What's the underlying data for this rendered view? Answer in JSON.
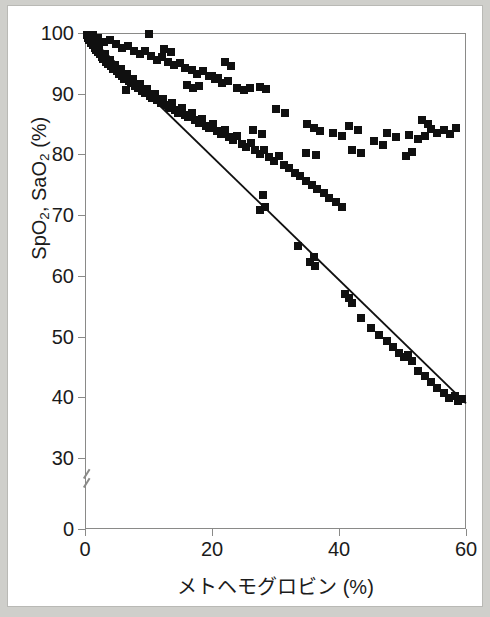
{
  "chart_data": {
    "type": "scatter",
    "title": "",
    "xlabel": "メトヘモグロビン (%)",
    "ylabel_parts": {
      "a": "SpO",
      "a_sub": "2",
      "mid": ", SaO",
      "b_sub": "2",
      "unit": " (%)"
    },
    "ylabel": "SpO2, SaO2 (%)",
    "xlim": [
      0,
      60
    ],
    "ylim": [
      30,
      100
    ],
    "y_broken_axis": true,
    "y_break_between": [
      0,
      30
    ],
    "grid": false,
    "legend": "none",
    "xticks": [
      0,
      20,
      40,
      60
    ],
    "yticks": [
      100,
      90,
      80,
      70,
      60,
      50,
      40,
      30,
      0
    ],
    "marker": "filled-square",
    "marker_color": "#101010",
    "line_color": "#101010",
    "trendline": {
      "label": "SaO2 regression",
      "x": [
        0,
        60
      ],
      "y": [
        100,
        39
      ]
    },
    "series": [
      {
        "name": "SaO2",
        "points": [
          [
            0.3,
            99.6
          ],
          [
            0.5,
            99.2
          ],
          [
            0.7,
            98.8
          ],
          [
            0.8,
            99.4
          ],
          [
            1.0,
            98.4
          ],
          [
            1.1,
            99.0
          ],
          [
            1.3,
            98.0
          ],
          [
            1.5,
            97.6
          ],
          [
            1.6,
            98.6
          ],
          [
            1.8,
            97.2
          ],
          [
            2.0,
            96.9
          ],
          [
            2.2,
            97.8
          ],
          [
            2.4,
            96.5
          ],
          [
            2.6,
            96.1
          ],
          [
            2.9,
            95.7
          ],
          [
            3.1,
            96.6
          ],
          [
            3.3,
            95.3
          ],
          [
            3.6,
            94.9
          ],
          [
            3.9,
            95.6
          ],
          [
            4.1,
            94.5
          ],
          [
            4.4,
            94.1
          ],
          [
            4.7,
            94.8
          ],
          [
            5.0,
            93.7
          ],
          [
            5.3,
            93.3
          ],
          [
            5.6,
            94.0
          ],
          [
            5.9,
            92.9
          ],
          [
            6.2,
            92.5
          ],
          [
            6.6,
            93.2
          ],
          [
            6.9,
            92.1
          ],
          [
            7.2,
            91.7
          ],
          [
            7.6,
            92.4
          ],
          [
            7.9,
            91.3
          ],
          [
            8.3,
            90.9
          ],
          [
            8.7,
            91.6
          ],
          [
            9.0,
            90.5
          ],
          [
            9.4,
            90.1
          ],
          [
            9.8,
            90.8
          ],
          [
            10.2,
            89.7
          ],
          [
            10.6,
            89.3
          ],
          [
            11.0,
            90.0
          ],
          [
            11.4,
            88.9
          ],
          [
            6.5,
            90.6
          ],
          [
            11.9,
            88.5
          ],
          [
            12.3,
            89.2
          ],
          [
            12.8,
            88.1
          ],
          [
            13.2,
            87.7
          ],
          [
            13.7,
            88.4
          ],
          [
            14.2,
            87.3
          ],
          [
            14.7,
            86.9
          ],
          [
            15.2,
            87.6
          ],
          [
            15.7,
            86.5
          ],
          [
            16.2,
            86.1
          ],
          [
            16.8,
            86.8
          ],
          [
            17.3,
            85.7
          ],
          [
            17.9,
            85.2
          ],
          [
            18.4,
            85.9
          ],
          [
            19.0,
            84.7
          ],
          [
            19.6,
            84.3
          ],
          [
            20.2,
            85.0
          ],
          [
            20.8,
            83.8
          ],
          [
            21.4,
            83.3
          ],
          [
            22.0,
            84.0
          ],
          [
            22.7,
            82.8
          ],
          [
            23.3,
            82.3
          ],
          [
            24.0,
            83.0
          ],
          [
            24.7,
            81.8
          ],
          [
            25.4,
            81.2
          ],
          [
            26.1,
            81.9
          ],
          [
            26.8,
            80.7
          ],
          [
            27.5,
            80.1
          ],
          [
            28.2,
            80.8
          ],
          [
            29.0,
            79.5
          ],
          [
            29.8,
            79.0
          ],
          [
            30.6,
            79.7
          ],
          [
            31.4,
            78.3
          ],
          [
            32.2,
            77.7
          ],
          [
            27.5,
            70.8
          ],
          [
            28.3,
            71.3
          ],
          [
            28.0,
            73.4
          ],
          [
            33.0,
            77.0
          ],
          [
            33.9,
            76.4
          ],
          [
            34.8,
            75.7
          ],
          [
            35.7,
            75.0
          ],
          [
            36.6,
            74.3
          ],
          [
            33.5,
            65.0
          ],
          [
            35.5,
            62.3
          ],
          [
            36.2,
            61.7
          ],
          [
            36.0,
            63.1
          ],
          [
            37.6,
            73.6
          ],
          [
            38.5,
            72.9
          ],
          [
            39.5,
            72.2
          ],
          [
            40.5,
            71.4
          ],
          [
            41.0,
            57.0
          ],
          [
            41.5,
            56.3
          ],
          [
            42.0,
            55.5
          ],
          [
            43.5,
            53.0
          ],
          [
            45.0,
            51.4
          ],
          [
            46.3,
            50.3
          ],
          [
            47.5,
            49.2
          ],
          [
            48.5,
            48.3
          ],
          [
            49.5,
            47.3
          ],
          [
            50.2,
            46.6
          ],
          [
            50.8,
            46.9
          ],
          [
            51.5,
            45.9
          ],
          [
            52.5,
            44.4
          ],
          [
            53.5,
            43.5
          ],
          [
            54.5,
            42.6
          ],
          [
            55.5,
            41.6
          ],
          [
            56.5,
            40.7
          ],
          [
            57.4,
            39.9
          ],
          [
            58.2,
            40.2
          ],
          [
            58.8,
            39.4
          ],
          [
            59.3,
            39.8
          ]
        ]
      },
      {
        "name": "SpO2",
        "points": [
          [
            1.2,
            99.7
          ],
          [
            2.1,
            99.1
          ],
          [
            3.0,
            98.5
          ],
          [
            4.0,
            98.9
          ],
          [
            4.9,
            98.2
          ],
          [
            5.8,
            97.6
          ],
          [
            6.8,
            97.9
          ],
          [
            7.7,
            97.1
          ],
          [
            8.6,
            96.6
          ],
          [
            9.5,
            97.0
          ],
          [
            10.4,
            96.2
          ],
          [
            11.3,
            95.6
          ],
          [
            12.2,
            96.0
          ],
          [
            13.1,
            95.2
          ],
          [
            14.0,
            94.7
          ],
          [
            14.9,
            95.1
          ],
          [
            15.8,
            94.3
          ],
          [
            10.0,
            99.9
          ],
          [
            12.5,
            97.4
          ],
          [
            13.5,
            96.8
          ],
          [
            16.8,
            93.9
          ],
          [
            17.7,
            93.3
          ],
          [
            18.6,
            93.7
          ],
          [
            19.5,
            92.9
          ],
          [
            16.0,
            91.5
          ],
          [
            17.0,
            90.9
          ],
          [
            18.0,
            91.2
          ],
          [
            20.5,
            92.4
          ],
          [
            21.5,
            91.8
          ],
          [
            22.5,
            92.1
          ],
          [
            22.0,
            95.3
          ],
          [
            23.0,
            94.6
          ],
          [
            24.0,
            91.0
          ],
          [
            25.0,
            90.6
          ],
          [
            26.0,
            90.9
          ],
          [
            27.5,
            91.1
          ],
          [
            28.5,
            90.7
          ],
          [
            20.0,
            93.0
          ],
          [
            21.0,
            92.6
          ],
          [
            30.0,
            87.5
          ],
          [
            31.5,
            86.8
          ],
          [
            26.5,
            84.0
          ],
          [
            27.8,
            83.3
          ],
          [
            35.0,
            85.0
          ],
          [
            36.0,
            84.4
          ],
          [
            37.0,
            83.8
          ],
          [
            34.8,
            80.3
          ],
          [
            36.3,
            79.9
          ],
          [
            39.0,
            83.6
          ],
          [
            40.5,
            83.0
          ],
          [
            41.5,
            84.7
          ],
          [
            43.0,
            84.1
          ],
          [
            42.0,
            80.7
          ],
          [
            43.5,
            80.2
          ],
          [
            45.5,
            82.2
          ],
          [
            47.0,
            81.6
          ],
          [
            47.5,
            83.5
          ],
          [
            49.0,
            82.9
          ],
          [
            50.5,
            79.8
          ],
          [
            51.5,
            80.4
          ],
          [
            51.0,
            83.2
          ],
          [
            52.5,
            82.6
          ],
          [
            53.5,
            83.0
          ],
          [
            54.5,
            84.2
          ],
          [
            55.5,
            83.6
          ],
          [
            56.5,
            84.0
          ],
          [
            57.5,
            83.4
          ],
          [
            58.5,
            84.3
          ],
          [
            53.0,
            85.6
          ],
          [
            54.0,
            85.0
          ]
        ]
      }
    ]
  }
}
